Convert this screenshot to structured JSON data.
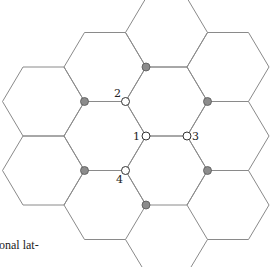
{
  "figure": {
    "type": "hexagonal-lattice",
    "edge_color": "#8a8a8a",
    "hex_edge_length": 41,
    "hex_half_height": 34.5,
    "hexagon_centers": [
      [
        166.5,
        32.5
      ],
      [
        105,
        67
      ],
      [
        228,
        67
      ],
      [
        43.5,
        101.5
      ],
      [
        166.5,
        101.5
      ],
      [
        105,
        136
      ],
      [
        228,
        136
      ],
      [
        43.5,
        170.5
      ],
      [
        166.5,
        170.5
      ],
      [
        105,
        205
      ],
      [
        228,
        205
      ]
    ],
    "extra_edges": [
      [
        [
          125.5,
          239.5
        ],
        [
          142,
          267
        ]
      ],
      [
        [
          207.5,
          239.5
        ],
        [
          191,
          267
        ]
      ]
    ],
    "labeled_sites": [
      {
        "label": "1",
        "x": 146,
        "y": 136,
        "label_x": 133,
        "label_y": 140
      },
      {
        "label": "2",
        "x": 125.5,
        "y": 101.5,
        "label_x": 114,
        "label_y": 97
      },
      {
        "label": "3",
        "x": 187,
        "y": 136,
        "label_x": 192,
        "label_y": 140
      },
      {
        "label": "4",
        "x": 125.5,
        "y": 170.5,
        "label_x": 116,
        "label_y": 183
      }
    ],
    "shaded_sites": [
      {
        "x": 146,
        "y": 67
      },
      {
        "x": 84.5,
        "y": 101.5
      },
      {
        "x": 207.5,
        "y": 101.5
      },
      {
        "x": 84.5,
        "y": 170.5
      },
      {
        "x": 207.5,
        "y": 170.5
      },
      {
        "x": 146,
        "y": 205
      }
    ]
  },
  "caption_fragment": "onal lat-"
}
